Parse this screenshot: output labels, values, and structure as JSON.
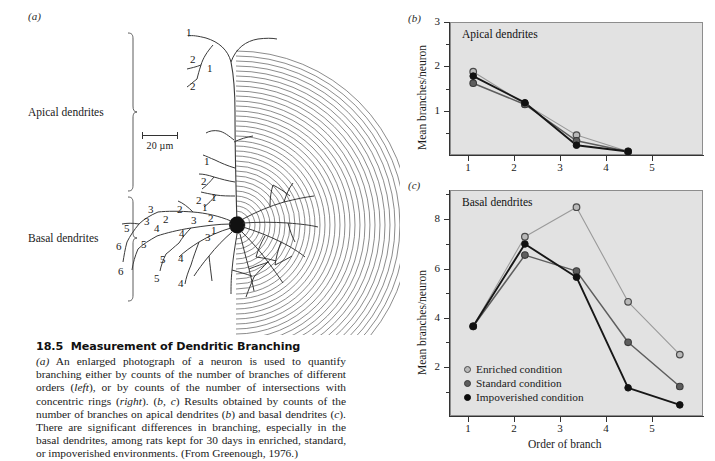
{
  "figure": {
    "number": "18.5",
    "title": "Measurement of Dendritic Branching",
    "caption": "(a) An enlarged photograph of a neuron is used to quantify branching either by counts of the number of branches of different orders (left), or by counts of the number of intersections with concentric rings (right). (b, c) Results obtained by counts of the number of branches on apical dendrites (b) and basal dendrites (c). There are significant differences in branching, especially in the basal dendrites, among rats kept for 30 days in enriched, standard, or impoverished environments. (From Greenough, 1976.)"
  },
  "panel_a": {
    "letter": "(a)",
    "apical_label": "Apical dendrites",
    "basal_label": "Basal dendrites",
    "scalebar_label": "20 µm",
    "branch_order_labels_apical": [
      "1",
      "2",
      "1",
      "2",
      "1",
      "2",
      "2"
    ],
    "branch_order_labels_basal": [
      "3",
      "2",
      "1",
      "3",
      "2",
      "2",
      "1",
      "5",
      "4",
      "3",
      "3",
      "6",
      "5",
      "4",
      "5",
      "4",
      "6",
      "5",
      "4"
    ]
  },
  "panel_b": {
    "letter": "(b)",
    "title": "Apical dendrites"
  },
  "panel_c": {
    "letter": "(c)",
    "title": "Basal dendrites"
  },
  "legend": {
    "items": [
      {
        "label": "Enriched condition",
        "marker": "open-gray-circle-icon",
        "color": "#b9b9b9"
      },
      {
        "label": "Standard condition",
        "marker": "gray-circle-icon",
        "color": "#5e5e5e"
      },
      {
        "label": "Impoverished condition",
        "marker": "black-circle-icon",
        "color": "#0d0d0d"
      }
    ]
  },
  "chart_data": [
    {
      "id": "apical",
      "type": "line",
      "title": "Apical dendrites",
      "xlabel": "",
      "ylabel": "Mean branches/neuron",
      "x": [
        1,
        2,
        3,
        4,
        5
      ],
      "xticklabels": [
        "1",
        "2",
        "3",
        "4",
        "5"
      ],
      "xlim": [
        0.55,
        5.45
      ],
      "ylim": [
        0,
        3
      ],
      "yticks": [
        1,
        2,
        3
      ],
      "yticklabels": [
        "1",
        "2",
        "3"
      ],
      "grid": false,
      "legend": "none",
      "series": [
        {
          "name": "Enriched condition",
          "color": "#9a9a9a",
          "marker": "open-gray-circle-icon",
          "x": [
            1,
            2,
            3,
            4
          ],
          "values": [
            1.88,
            1.15,
            0.45,
            0.08
          ]
        },
        {
          "name": "Standard condition",
          "color": "#5e5e5e",
          "marker": "gray-circle-icon",
          "x": [
            1,
            2,
            3,
            4
          ],
          "values": [
            1.62,
            1.14,
            0.32,
            0.08
          ]
        },
        {
          "name": "Impoverished condition",
          "color": "#171717",
          "marker": "black-circle-icon",
          "x": [
            1,
            2,
            3,
            4
          ],
          "values": [
            1.78,
            1.18,
            0.22,
            0.08
          ]
        }
      ]
    },
    {
      "id": "basal",
      "type": "line",
      "title": "Basal dendrites",
      "xlabel": "Order of branch",
      "ylabel": "Mean branches/neuron",
      "x": [
        1,
        2,
        3,
        4,
        5
      ],
      "xticklabels": [
        "1",
        "2",
        "3",
        "4",
        "5"
      ],
      "xlim": [
        0.55,
        5.45
      ],
      "ylim": [
        0,
        9.2
      ],
      "yticks": [
        2,
        4,
        6,
        8
      ],
      "yticklabels": [
        "2",
        "4",
        "6",
        "8"
      ],
      "grid": false,
      "legend": "lower-left",
      "series": [
        {
          "name": "Enriched condition",
          "color": "#9a9a9a",
          "marker": "open-gray-circle-icon",
          "x": [
            1,
            2,
            3,
            4,
            5
          ],
          "values": [
            3.65,
            7.3,
            8.5,
            4.65,
            2.5
          ]
        },
        {
          "name": "Standard condition",
          "color": "#5e5e5e",
          "marker": "gray-circle-icon",
          "x": [
            1,
            2,
            3,
            4,
            5
          ],
          "values": [
            3.65,
            6.55,
            5.9,
            3.0,
            1.2
          ]
        },
        {
          "name": "Impoverished condition",
          "color": "#171717",
          "marker": "black-circle-icon",
          "x": [
            1,
            2,
            3,
            4,
            5
          ],
          "values": [
            3.65,
            7.0,
            5.65,
            1.15,
            0.45
          ]
        }
      ]
    }
  ]
}
